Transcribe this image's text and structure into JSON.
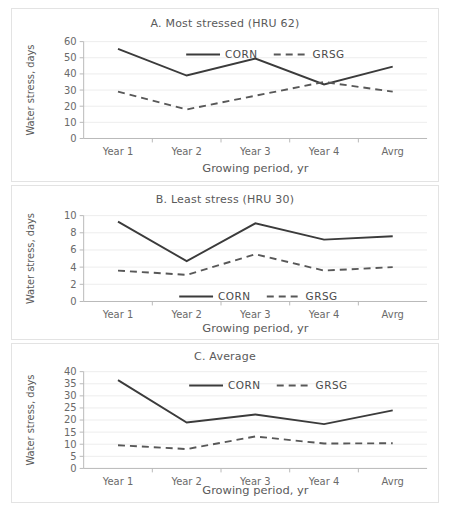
{
  "figure": {
    "name": "water-stress-growing-period-figure",
    "panel_count": 3
  },
  "axis_titles": {
    "y": "Water stress, days",
    "x": "Growing period, yr"
  },
  "legend": {
    "corn": "CORN",
    "grsg": "GRSG"
  },
  "categories": [
    "Year 1",
    "Year 2",
    "Year 3",
    "Year 4",
    "Avrg"
  ],
  "panels": [
    {
      "id": "a",
      "title": "A. Most stressed (HRU 62)",
      "yticks": [
        "0",
        "10",
        "20",
        "30",
        "40",
        "50",
        "60"
      ]
    },
    {
      "id": "b",
      "title": "B. Least stress (HRU 30)",
      "yticks": [
        "0",
        "2",
        "4",
        "6",
        "8",
        "10"
      ]
    },
    {
      "id": "c",
      "title": "C. Average",
      "yticks": [
        "0",
        "5",
        "10",
        "15",
        "20",
        "25",
        "30",
        "35",
        "40"
      ]
    }
  ],
  "chart_data": [
    {
      "type": "line",
      "title": "A. Most stressed (HRU 62)",
      "xlabel": "Growing period, yr",
      "ylabel": "Water stress, days",
      "categories": [
        "Year 1",
        "Year 2",
        "Year 3",
        "Year 4",
        "Avrg"
      ],
      "ylim": [
        0,
        60
      ],
      "ytick_step": 10,
      "grid": true,
      "legend_position": "top-center",
      "series": [
        {
          "name": "CORN",
          "style": "solid",
          "values": [
            55.5,
            39.0,
            49.5,
            33.5,
            44.5
          ]
        },
        {
          "name": "GRSG",
          "style": "dashed",
          "values": [
            29.0,
            18.0,
            26.5,
            35.0,
            29.0
          ]
        }
      ]
    },
    {
      "type": "line",
      "title": "B. Least stress (HRU 30)",
      "xlabel": "Growing period, yr",
      "ylabel": "Water stress, days",
      "categories": [
        "Year 1",
        "Year 2",
        "Year 3",
        "Year 4",
        "Avrg"
      ],
      "ylim": [
        0,
        10
      ],
      "ytick_step": 2,
      "grid": true,
      "legend_position": "bottom-center",
      "series": [
        {
          "name": "CORN",
          "style": "solid",
          "values": [
            9.3,
            4.7,
            9.1,
            7.2,
            7.6
          ]
        },
        {
          "name": "GRSG",
          "style": "dashed",
          "values": [
            3.6,
            3.1,
            5.5,
            3.6,
            4.0
          ]
        }
      ]
    },
    {
      "type": "line",
      "title": "C. Average",
      "xlabel": "Growing period, yr",
      "ylabel": "Water stress, days",
      "categories": [
        "Year 1",
        "Year 2",
        "Year 3",
        "Year 4",
        "Avrg"
      ],
      "ylim": [
        0,
        40
      ],
      "ytick_step": 5,
      "grid": true,
      "legend_position": "top-center",
      "series": [
        {
          "name": "CORN",
          "style": "solid",
          "values": [
            36.5,
            19.0,
            22.3,
            18.3,
            24.0
          ]
        },
        {
          "name": "GRSG",
          "style": "dashed",
          "values": [
            9.6,
            8.0,
            13.2,
            10.3,
            10.4
          ]
        }
      ]
    }
  ],
  "colors": {
    "corn_line": "#3b3b3b",
    "grsg_line": "#585858",
    "grid": "#ededed",
    "axis": "#b9b9b9",
    "text": "#5a5a5a",
    "panel_border": "#e3e3e3",
    "background": "#ffffff"
  }
}
